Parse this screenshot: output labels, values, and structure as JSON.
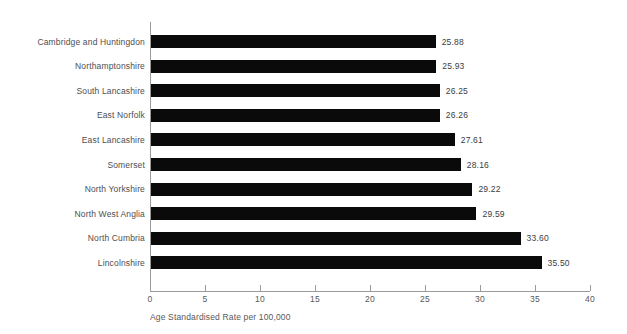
{
  "chart_data": {
    "type": "bar",
    "orientation": "horizontal",
    "title": "",
    "subtitle": "",
    "xlabel": "Age Standardised Rate per 100,000",
    "ylabel": "",
    "xlim": [
      0,
      40
    ],
    "xticks": [
      "0",
      "5",
      "10",
      "15",
      "20",
      "25",
      "30",
      "35",
      "40"
    ],
    "xtick_values": [
      0,
      5,
      10,
      15,
      20,
      25,
      30,
      35,
      40
    ],
    "grid": false,
    "legend": "none",
    "bar_color": "#0a0a0a",
    "axis_color": "#9a9a9a",
    "categories": [
      "Cambridge and Huntingdon",
      "Northamptonshire",
      "South Lancashire",
      "East Norfolk",
      "East Lancashire",
      "Somerset",
      "North Yorkshire",
      "North West Anglia",
      "North Cumbria",
      "Lincolnshire"
    ],
    "values": [
      25.88,
      25.93,
      26.25,
      26.26,
      27.61,
      28.16,
      29.22,
      29.59,
      33.6,
      35.5
    ],
    "data_labels": [
      "25.88",
      "25.93",
      "26.25",
      "26.26",
      "27.61",
      "28.16",
      "29.22",
      "29.59",
      "33.60",
      "35.50"
    ]
  }
}
